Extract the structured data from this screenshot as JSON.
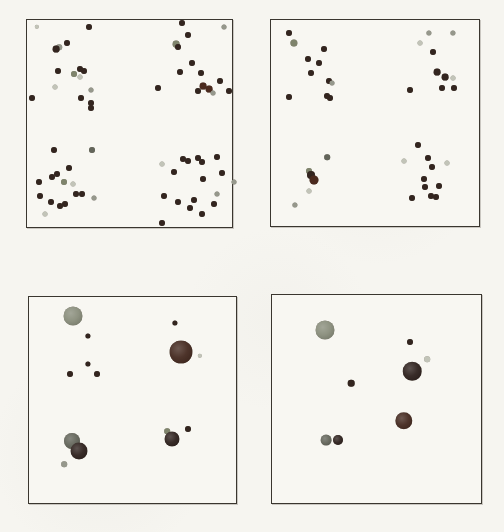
{
  "figure": {
    "background_color": "#f6f5f0",
    "panel_border_color": "#3a362f",
    "colors": {
      "dark": "#33251f",
      "darkred": "#4b2a1e",
      "darkbig": "#2e211d",
      "darkredbig": "#44291f",
      "olive": "#7f846c",
      "olivebig": "#898d7b",
      "graydark": "#63655a",
      "gray": "#96988c",
      "light": "#c2c4b8"
    }
  },
  "chart_data": [
    {
      "type": "scatter",
      "panel": "top-left",
      "title": "",
      "xlabel": "",
      "ylabel": "",
      "axes_visible": false,
      "grid": false,
      "legend": false,
      "frame_px": {
        "x": 26,
        "y": 19,
        "w": 207,
        "h": 209
      },
      "units": "point coords are pixels relative to panel top-left corner: [x, y, radius, color_class]",
      "points": [
        [
          10,
          7,
          2.2,
          "light"
        ],
        [
          62,
          7,
          3,
          "dark"
        ],
        [
          40,
          23,
          3,
          "dark"
        ],
        [
          32,
          27,
          2.8,
          "gray"
        ],
        [
          29,
          29,
          3.4,
          "dark"
        ],
        [
          31,
          51,
          3,
          "dark"
        ],
        [
          53,
          49,
          3,
          "dark"
        ],
        [
          57,
          51,
          3,
          "dark"
        ],
        [
          47,
          54,
          3,
          "olive"
        ],
        [
          53,
          57,
          2.5,
          "light"
        ],
        [
          28,
          67,
          2.5,
          "light"
        ],
        [
          5,
          78,
          3,
          "dark"
        ],
        [
          64,
          70,
          2.5,
          "gray"
        ],
        [
          54,
          78,
          3,
          "dark"
        ],
        [
          64,
          83,
          3,
          "dark"
        ],
        [
          64,
          88,
          3,
          "dark"
        ],
        [
          155,
          3,
          3,
          "dark"
        ],
        [
          197,
          7,
          2.5,
          "gray"
        ],
        [
          161,
          15,
          3,
          "dark"
        ],
        [
          149,
          24,
          3.4,
          "olive"
        ],
        [
          151,
          27,
          3,
          "dark"
        ],
        [
          165,
          43,
          3,
          "dark"
        ],
        [
          153,
          52,
          3,
          "dark"
        ],
        [
          174,
          53,
          3,
          "dark"
        ],
        [
          193,
          61,
          3,
          "dark"
        ],
        [
          131,
          68,
          3,
          "dark"
        ],
        [
          176,
          66,
          3.4,
          "darkred"
        ],
        [
          182,
          69,
          3.4,
          "darkred"
        ],
        [
          171,
          71,
          3,
          "dark"
        ],
        [
          186,
          73,
          2.5,
          "gray"
        ],
        [
          202,
          71,
          3,
          "dark"
        ],
        [
          27,
          130,
          3,
          "dark"
        ],
        [
          65,
          130,
          3,
          "graydark"
        ],
        [
          42,
          148,
          3,
          "dark"
        ],
        [
          25,
          157,
          3,
          "dark"
        ],
        [
          30,
          154,
          3,
          "dark"
        ],
        [
          12,
          162,
          3,
          "dark"
        ],
        [
          37,
          162,
          3,
          "olive"
        ],
        [
          46,
          164,
          2.5,
          "light"
        ],
        [
          13,
          176,
          3,
          "dark"
        ],
        [
          24,
          182,
          3,
          "dark"
        ],
        [
          33,
          186,
          3,
          "dark"
        ],
        [
          38,
          184,
          3,
          "dark"
        ],
        [
          49,
          174,
          3,
          "dark"
        ],
        [
          55,
          174,
          3,
          "dark"
        ],
        [
          67,
          178,
          2.5,
          "gray"
        ],
        [
          18,
          194,
          2.5,
          "light"
        ],
        [
          135,
          144,
          2.5,
          "light"
        ],
        [
          156,
          139,
          3,
          "dark"
        ],
        [
          161,
          141,
          3,
          "dark"
        ],
        [
          171,
          138,
          3,
          "dark"
        ],
        [
          175,
          142,
          3,
          "dark"
        ],
        [
          190,
          137,
          3,
          "dark"
        ],
        [
          147,
          152,
          3,
          "dark"
        ],
        [
          176,
          159,
          3,
          "dark"
        ],
        [
          195,
          153,
          3,
          "dark"
        ],
        [
          207,
          162,
          2.5,
          "gray"
        ],
        [
          137,
          176,
          3,
          "dark"
        ],
        [
          151,
          182,
          3,
          "dark"
        ],
        [
          167,
          180,
          3,
          "dark"
        ],
        [
          190,
          174,
          2.5,
          "gray"
        ],
        [
          187,
          184,
          3,
          "dark"
        ],
        [
          163,
          188,
          3,
          "dark"
        ],
        [
          175,
          194,
          3,
          "dark"
        ],
        [
          135,
          203,
          3,
          "dark"
        ]
      ]
    },
    {
      "type": "scatter",
      "panel": "top-right",
      "title": "",
      "xlabel": "",
      "ylabel": "",
      "axes_visible": false,
      "grid": false,
      "legend": false,
      "frame_px": {
        "x": 270,
        "y": 19,
        "w": 210,
        "h": 208
      },
      "units": "point coords are pixels relative to panel top-left corner: [x, y, radius, color_class]",
      "points": [
        [
          18,
          13,
          3,
          "dark"
        ],
        [
          23,
          23,
          3.6,
          "olive"
        ],
        [
          53,
          29,
          3,
          "dark"
        ],
        [
          37,
          39,
          3,
          "dark"
        ],
        [
          48,
          43,
          3,
          "dark"
        ],
        [
          40,
          53,
          3,
          "dark"
        ],
        [
          58,
          61,
          3,
          "dark"
        ],
        [
          61,
          63,
          2.5,
          "gray"
        ],
        [
          18,
          77,
          3,
          "dark"
        ],
        [
          56,
          76,
          3,
          "dark"
        ],
        [
          59,
          78,
          3,
          "dark"
        ],
        [
          158,
          13,
          2.6,
          "gray"
        ],
        [
          182,
          13,
          2.6,
          "gray"
        ],
        [
          149,
          23,
          2.5,
          "light"
        ],
        [
          162,
          32,
          3,
          "dark"
        ],
        [
          166,
          52,
          3.4,
          "dark"
        ],
        [
          174,
          57,
          3.4,
          "dark"
        ],
        [
          182,
          58,
          2.5,
          "light"
        ],
        [
          171,
          68,
          3,
          "dark"
        ],
        [
          183,
          68,
          3,
          "dark"
        ],
        [
          139,
          70,
          3,
          "dark"
        ],
        [
          56,
          137,
          2.8,
          "graydark"
        ],
        [
          38,
          151,
          3,
          "olive"
        ],
        [
          40,
          155,
          4,
          "dark"
        ],
        [
          43,
          160,
          4.5,
          "darkred"
        ],
        [
          38,
          171,
          2.5,
          "light"
        ],
        [
          24,
          185,
          2.6,
          "gray"
        ],
        [
          147,
          125,
          3,
          "dark"
        ],
        [
          133,
          141,
          2.5,
          "light"
        ],
        [
          157,
          138,
          3,
          "dark"
        ],
        [
          161,
          147,
          3,
          "dark"
        ],
        [
          176,
          143,
          2.5,
          "light"
        ],
        [
          153,
          159,
          3,
          "dark"
        ],
        [
          154,
          167,
          3,
          "dark"
        ],
        [
          168,
          166,
          3,
          "dark"
        ],
        [
          141,
          178,
          3,
          "dark"
        ],
        [
          160,
          176,
          3,
          "dark"
        ],
        [
          165,
          177,
          3,
          "dark"
        ]
      ]
    },
    {
      "type": "scatter",
      "panel": "bottom-left",
      "title": "",
      "xlabel": "",
      "ylabel": "",
      "axes_visible": false,
      "grid": false,
      "legend": false,
      "frame_px": {
        "x": 28,
        "y": 296,
        "w": 209,
        "h": 208
      },
      "units": "point coords are pixels relative to panel top-left corner: [x, y, radius, color_class]",
      "points": [
        [
          44,
          19,
          9.5,
          "olivebig"
        ],
        [
          59,
          39,
          2.6,
          "dark"
        ],
        [
          59,
          67,
          2.6,
          "dark"
        ],
        [
          41,
          77,
          3,
          "dark"
        ],
        [
          68,
          77,
          3,
          "dark"
        ],
        [
          146,
          26,
          2.6,
          "dark"
        ],
        [
          152,
          55,
          11.5,
          "darkredbig"
        ],
        [
          171,
          59,
          2.2,
          "light"
        ],
        [
          138,
          134,
          2.8,
          "olive"
        ],
        [
          143,
          142,
          7.5,
          "darkbig"
        ],
        [
          159,
          132,
          3,
          "dark"
        ],
        [
          43,
          144,
          8,
          "graydark"
        ],
        [
          50,
          154,
          8.5,
          "darkbig"
        ],
        [
          35,
          167,
          2.8,
          "gray"
        ]
      ]
    },
    {
      "type": "scatter",
      "panel": "bottom-right",
      "title": "",
      "xlabel": "",
      "ylabel": "",
      "axes_visible": false,
      "grid": false,
      "legend": false,
      "frame_px": {
        "x": 271,
        "y": 294,
        "w": 211,
        "h": 210
      },
      "units": "point coords are pixels relative to panel top-left corner: [x, y, radius, color_class]",
      "points": [
        [
          53,
          35,
          9.5,
          "olivebig"
        ],
        [
          138,
          47,
          3,
          "dark"
        ],
        [
          155,
          64,
          2.8,
          "light"
        ],
        [
          140,
          76,
          9.3,
          "darkbig"
        ],
        [
          79,
          88,
          3.3,
          "dark"
        ],
        [
          132,
          126,
          8.7,
          "darkredbig"
        ],
        [
          54,
          145,
          5.4,
          "graydark"
        ],
        [
          66,
          145,
          5,
          "darkbig"
        ]
      ]
    }
  ]
}
